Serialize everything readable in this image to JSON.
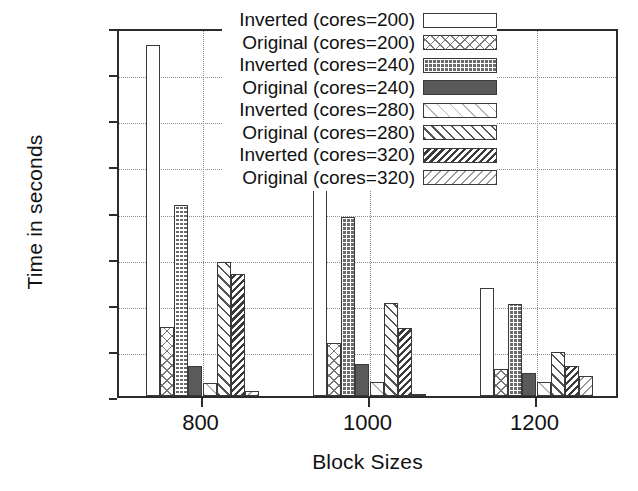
{
  "chart_data": {
    "type": "bar",
    "title": "",
    "xlabel": "Block Sizes",
    "ylabel": "Time in seconds",
    "categories": [
      "800",
      "1000",
      "1200"
    ],
    "ylim": [
      40,
      200
    ],
    "yticks": [
      40,
      60,
      80,
      100,
      120,
      140,
      160,
      180,
      200
    ],
    "grid": true,
    "legend_position": "top-right inside",
    "series": [
      {
        "name": "Inverted (cores=200)",
        "pattern": "plain-white",
        "values": [
          192,
          157,
          87
        ]
      },
      {
        "name": "Original (cores=200)",
        "pattern": "light-crosshatch",
        "values": [
          70,
          63,
          51.5
        ]
      },
      {
        "name": "Inverted (cores=240)",
        "pattern": "dark-checker",
        "values": [
          123,
          117.5,
          80
        ]
      },
      {
        "name": "Original (cores=240)",
        "pattern": "solid-dark-grey",
        "values": [
          53,
          54,
          50
        ]
      },
      {
        "name": "Inverted (cores=280)",
        "pattern": "faint-back-hatch",
        "values": [
          45.5,
          46,
          46
        ]
      },
      {
        "name": "Original (cores=280)",
        "pattern": "medium-fwd-hatch",
        "values": [
          98,
          80.5,
          59
        ]
      },
      {
        "name": "Inverted (cores=320)",
        "pattern": "dense-dark-hatch",
        "values": [
          93,
          69.5,
          53
        ]
      },
      {
        "name": "Original (cores=320)",
        "pattern": "light-fwd-hatch",
        "values": [
          42,
          41,
          48.5
        ]
      }
    ]
  },
  "legend": {
    "items": [
      {
        "label": "Inverted (cores=200)"
      },
      {
        "label": "Original (cores=200)"
      },
      {
        "label": "Inverted (cores=240)"
      },
      {
        "label": "Original (cores=240)"
      },
      {
        "label": "Inverted (cores=280)"
      },
      {
        "label": "Original (cores=280)"
      },
      {
        "label": "Inverted (cores=320)"
      },
      {
        "label": "Original (cores=320)"
      }
    ]
  },
  "axes": {
    "y_title": "Time in seconds",
    "x_title": "Block Sizes",
    "y_tick_labels": [
      "200",
      "180",
      "160",
      "140",
      "120",
      "100",
      "80",
      "60",
      "40"
    ],
    "x_tick_labels": [
      "800",
      "1000",
      "1200"
    ]
  },
  "colors": {
    "frame": "#2b2b2b",
    "grid": "#8d8d8d",
    "bar_outline": "#3a3a3a",
    "background": "#ffffff"
  }
}
